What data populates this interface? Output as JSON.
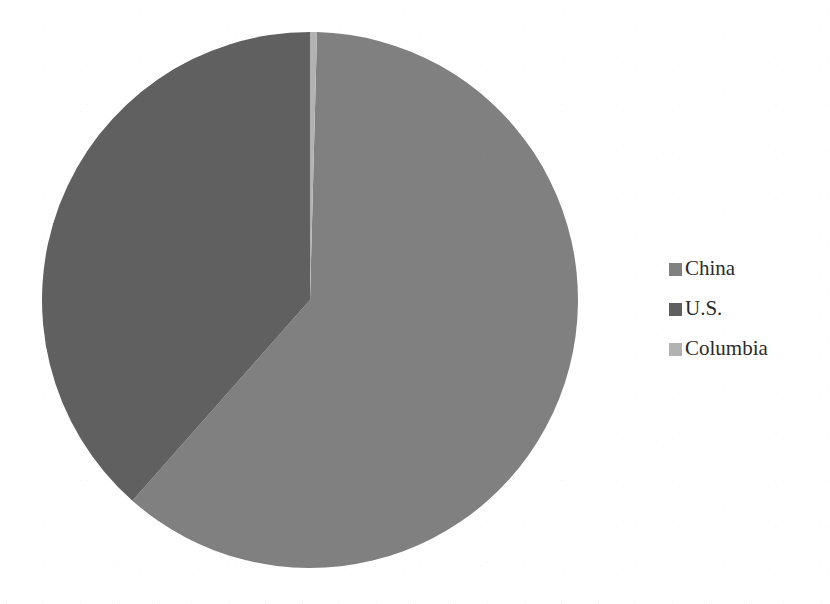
{
  "chart_data": {
    "type": "pie",
    "title": "",
    "subtitle": "",
    "xlabel": "",
    "ylabel": "",
    "grid": false,
    "legend_position": "right",
    "categories": [
      "China",
      "U.S.",
      "Columbia"
    ],
    "values": [
      61.1,
      38.5,
      0.4
    ],
    "units": "percent",
    "start_angle_deg": 0,
    "direction": "clockwise",
    "slices": [
      {
        "label": "China",
        "value": 61.1,
        "color": "#808080",
        "start_angle_deg": 1.5,
        "end_angle_deg": 221.5
      },
      {
        "label": "U.S.",
        "value": 38.5,
        "color": "#606060",
        "start_angle_deg": 221.5,
        "end_angle_deg": 360.0
      },
      {
        "label": "Columbia",
        "value": 0.4,
        "color": "#b2b2b2",
        "start_angle_deg": 0.0,
        "end_angle_deg": 1.5
      }
    ]
  },
  "legend": {
    "items": [
      {
        "label": "China",
        "color": "#808080",
        "swatch_name": "legend-swatch-china"
      },
      {
        "label": "U.S.",
        "color": "#606060",
        "swatch_name": "legend-swatch-us"
      },
      {
        "label": "Columbia",
        "color": "#b2b2b2",
        "swatch_name": "legend-swatch-columbia"
      }
    ]
  },
  "colors": {
    "background": "#ffffff",
    "china": "#808080",
    "us": "#606060",
    "columbia": "#b2b2b2",
    "text": "#2b2b2b"
  },
  "geometry": {
    "center_x": 310,
    "center_y": 300,
    "radius": 268
  }
}
